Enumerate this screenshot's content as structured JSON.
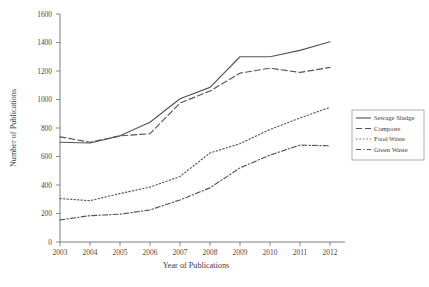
{
  "chart_data": {
    "type": "line",
    "title": "",
    "xlabel": "Year of Publications",
    "ylabel": "Number of Publications",
    "categories": [
      "2003",
      "2004",
      "2005",
      "2006",
      "2007",
      "2008",
      "2009",
      "2010",
      "2011",
      "2012"
    ],
    "x": [
      2003,
      2004,
      2005,
      2006,
      2007,
      2008,
      2009,
      2010,
      2011,
      2012
    ],
    "ylim": [
      0,
      1600
    ],
    "yticks": [
      0,
      200,
      400,
      600,
      800,
      1000,
      1200,
      1400,
      1600
    ],
    "ytick_labels": [
      "0",
      "200",
      "400",
      "600",
      "800",
      "1000",
      "1200",
      "1400",
      "1600"
    ],
    "grid": false,
    "legend_position": "right",
    "series": [
      {
        "name": "Sewage Sludge",
        "style": "solid",
        "color": "#555555",
        "values": [
          700,
          695,
          745,
          840,
          1005,
          1085,
          1300,
          1300,
          1345,
          1405
        ]
      },
      {
        "name": "Composts",
        "style": "dashed",
        "color": "#555555",
        "values": [
          738,
          700,
          745,
          760,
          975,
          1060,
          1185,
          1220,
          1190,
          1225
        ]
      },
      {
        "name": "Food Waste",
        "style": "dotted",
        "color": "#555555",
        "values": [
          305,
          290,
          340,
          385,
          460,
          625,
          690,
          790,
          870,
          945
        ]
      },
      {
        "name": "Green Waste",
        "style": "dash-dot",
        "color": "#555555",
        "values": [
          155,
          185,
          195,
          225,
          295,
          380,
          520,
          610,
          680,
          675
        ]
      }
    ]
  },
  "axes": {
    "y_title": "Number of Publications",
    "x_title": "Year of Publications"
  },
  "legend": {
    "items": [
      {
        "label": "Sewage Sludge"
      },
      {
        "label": "Composts"
      },
      {
        "label": "Food Waste"
      },
      {
        "label": "Green Waste"
      }
    ]
  }
}
